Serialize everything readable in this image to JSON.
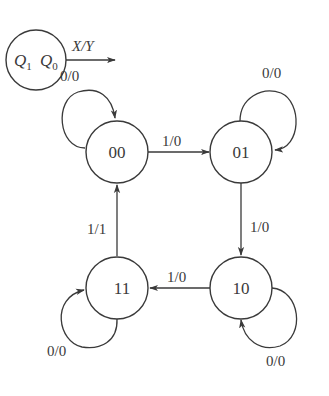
{
  "legend": {
    "q1": "Q",
    "q1_sub": "1",
    "q0": "Q",
    "q0_sub": "0",
    "io_label": "X/Y"
  },
  "states": [
    {
      "id": "s00",
      "label": "00"
    },
    {
      "id": "s01",
      "label": "01"
    },
    {
      "id": "s10",
      "label": "10"
    },
    {
      "id": "s11",
      "label": "11"
    }
  ],
  "transitions": [
    {
      "from": "00",
      "to": "00",
      "label": "0/0"
    },
    {
      "from": "00",
      "to": "01",
      "label": "1/0"
    },
    {
      "from": "01",
      "to": "01",
      "label": "0/0"
    },
    {
      "from": "01",
      "to": "10",
      "label": "1/0"
    },
    {
      "from": "10",
      "to": "10",
      "label": "0/0"
    },
    {
      "from": "10",
      "to": "11",
      "label": "1/0"
    },
    {
      "from": "11",
      "to": "11",
      "label": "0/0"
    },
    {
      "from": "11",
      "to": "00",
      "label": "1/1"
    }
  ],
  "colors": {
    "stroke": "#3a3a3a",
    "background": "#ffffff"
  }
}
